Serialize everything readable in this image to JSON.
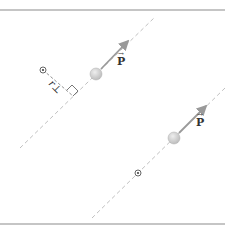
{
  "diagram": {
    "title": "",
    "borders": {
      "top_y": 10,
      "bottom_y": 224,
      "x_end": 225,
      "color": "#8c8c8c"
    },
    "colors": {
      "dashed_line": "#b9b9b9",
      "arrow": "#9a9a9a",
      "ball_fill": "#c8c8c8",
      "ball_highlight": "#ececec",
      "text": "#333333"
    },
    "scenarios": [
      {
        "line": {
          "x1": 20,
          "y1": 148,
          "x2": 155,
          "y2": 17
        },
        "ball": {
          "cx": 96,
          "cy": 74,
          "r": 6
        },
        "momentum_arrow": {
          "x1": 101,
          "y1": 69,
          "x2": 128,
          "y2": 41
        },
        "momentum_label": "P",
        "origin": {
          "cx": 43,
          "cy": 70,
          "symbol": "dot-in-circle"
        },
        "perpendicular_label": "r⊥",
        "perpendicular_segment": {
          "x1": 43,
          "y1": 70,
          "x2": 73,
          "y2": 96
        }
      },
      {
        "line": {
          "x1": 92,
          "y1": 218,
          "x2": 225,
          "y2": 88
        },
        "ball": {
          "cx": 174,
          "cy": 138,
          "r": 6
        },
        "momentum_arrow": {
          "x1": 179,
          "y1": 133,
          "x2": 206,
          "y2": 106
        },
        "momentum_label": "P",
        "origin": {
          "cx": 138,
          "cy": 173,
          "symbol": "dot-in-circle"
        }
      }
    ]
  }
}
